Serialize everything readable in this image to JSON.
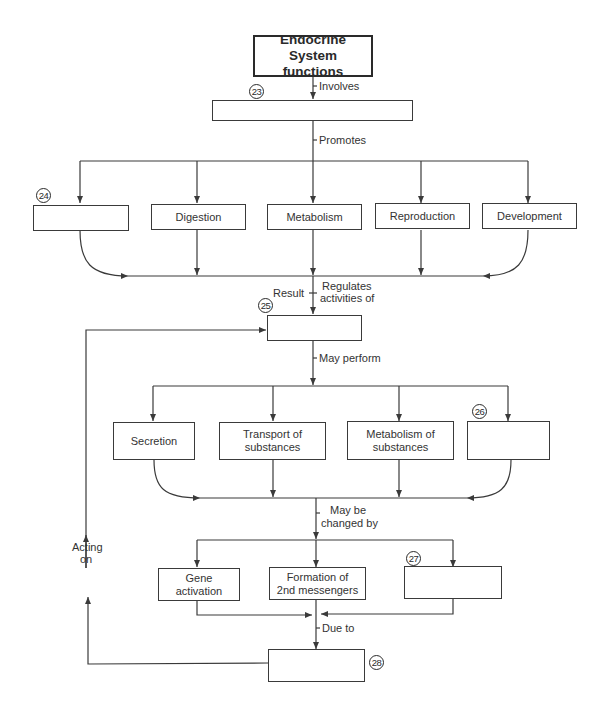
{
  "title": "Endocrine System functions",
  "nodes": {
    "n23": {
      "number": "23",
      "text": ""
    },
    "n24": {
      "number": "24",
      "text": ""
    },
    "digestion": {
      "text": "Digestion"
    },
    "metabolism": {
      "text": "Metabolism"
    },
    "reproduction": {
      "text": "Reproduction"
    },
    "development": {
      "text": "Development"
    },
    "n25": {
      "number": "25",
      "text": ""
    },
    "secretion": {
      "text": "Secretion"
    },
    "transport": {
      "line1": "Transport of",
      "line2": "substances"
    },
    "metabolism_of": {
      "line1": "Metabolism of",
      "line2": "substances"
    },
    "n26": {
      "number": "26",
      "text": ""
    },
    "gene_activation": {
      "line1": "Gene",
      "line2": "activation"
    },
    "second_messengers": {
      "line1": "Formation of",
      "line2": "2nd messengers"
    },
    "n27": {
      "number": "27",
      "text": ""
    },
    "n28": {
      "number": "28",
      "text": ""
    }
  },
  "edges": {
    "involves": "Involves",
    "promotes": "Promotes",
    "result": "Result",
    "regulates_1": "Regulates",
    "regulates_2": "activities of",
    "may_perform": "May perform",
    "may_be_1": "May be",
    "may_be_2": "changed by",
    "due_to": "Due to",
    "acting_1": "Acting",
    "acting_2": "on"
  },
  "colors": {
    "line": "#3a3a3a",
    "text": "#333333",
    "background": "#ffffff"
  }
}
